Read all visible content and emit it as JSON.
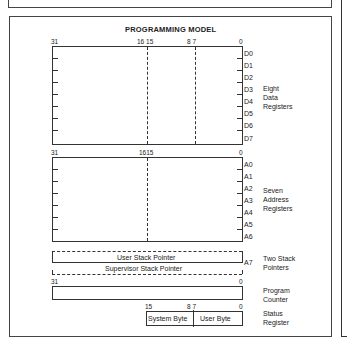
{
  "title": "PROGRAMMING MODEL",
  "data_registers": {
    "bit_labels": {
      "b31": "31",
      "b16_15": "16 15",
      "b8_7": "8 7",
      "b0": "0"
    },
    "registers": [
      "D0",
      "D1",
      "D2",
      "D3",
      "D4",
      "D5",
      "D6",
      "D7"
    ],
    "description": [
      "Eight",
      "Data",
      "Registers"
    ]
  },
  "address_registers": {
    "bit_labels": {
      "b31": "31",
      "b16_15": "1615",
      "b0": "0"
    },
    "registers": [
      "A0",
      "A1",
      "A2",
      "A3",
      "A4",
      "A5",
      "A6"
    ],
    "description": [
      "Seven",
      "Address",
      "Registers"
    ]
  },
  "stack_pointers": {
    "user": "User Stack Pointer",
    "supervisor": "Supervisor Stack Pointer",
    "register": "A7",
    "description": [
      "Two Stack",
      "Pointers"
    ]
  },
  "program_counter": {
    "bit_labels": {
      "b31": "31",
      "b0": "0"
    },
    "description": [
      "Program",
      "Counter"
    ]
  },
  "status_register": {
    "bit_labels": {
      "b15": "15",
      "b8_7": "8 7",
      "b0": "0"
    },
    "system_byte": "System Byte",
    "user_byte": "User Byte",
    "description": [
      "Status",
      "Register"
    ]
  }
}
